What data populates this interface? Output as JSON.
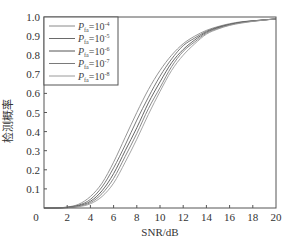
{
  "chart_data": {
    "type": "line",
    "title": "",
    "xlabel": "SNR/dB",
    "ylabel": "检测概率",
    "xlim": [
      0,
      20
    ],
    "ylim": [
      0,
      1.0
    ],
    "grid": false,
    "legend_position": "upper left",
    "x_ticks": [
      0,
      2,
      4,
      6,
      8,
      10,
      12,
      14,
      16,
      18,
      20
    ],
    "x_tick_labels": [
      "0",
      "2",
      "4",
      "6",
      "8",
      "10",
      "12",
      "14",
      "16",
      "18",
      "20"
    ],
    "y_ticks": [
      0.1,
      0.2,
      0.3,
      0.4,
      0.5,
      0.6,
      0.7,
      0.8,
      0.9,
      1.0
    ],
    "y_tick_labels": [
      "0.1",
      "0.2",
      "0.3",
      "0.4",
      "0.5",
      "0.6",
      "0.7",
      "0.8",
      "0.9",
      "1.0"
    ],
    "x": [
      0,
      1,
      2,
      3,
      4,
      5,
      6,
      7,
      8,
      9,
      10,
      11,
      12,
      13,
      14,
      15,
      16,
      17,
      18,
      19,
      20
    ],
    "series": [
      {
        "name": "P_fa=10^-4",
        "label_base": "P",
        "label_sub": "fa",
        "label_eq": "=10",
        "label_sup": "-4",
        "color": "#8a8a8a",
        "values": [
          0.0,
          0.0,
          0.005,
          0.02,
          0.06,
          0.13,
          0.24,
          0.37,
          0.5,
          0.62,
          0.72,
          0.8,
          0.86,
          0.9,
          0.93,
          0.95,
          0.965,
          0.975,
          0.98,
          0.985,
          0.99
        ]
      },
      {
        "name": "P_fa=10^-5",
        "label_base": "P",
        "label_sub": "fa",
        "label_eq": "=10",
        "label_sup": "-5",
        "color": "#6a6a6a",
        "values": [
          0.0,
          0.0,
          0.004,
          0.015,
          0.045,
          0.11,
          0.21,
          0.33,
          0.46,
          0.58,
          0.69,
          0.78,
          0.85,
          0.89,
          0.925,
          0.947,
          0.962,
          0.973,
          0.98,
          0.985,
          0.99
        ]
      },
      {
        "name": "P_fa=10^-6",
        "label_base": "P",
        "label_sub": "fa",
        "label_eq": "=10",
        "label_sup": "-6",
        "color": "#555555",
        "values": [
          0.0,
          0.0,
          0.003,
          0.012,
          0.035,
          0.09,
          0.18,
          0.3,
          0.42,
          0.55,
          0.66,
          0.76,
          0.83,
          0.88,
          0.92,
          0.944,
          0.96,
          0.972,
          0.979,
          0.985,
          0.99
        ]
      },
      {
        "name": "P_fa=10^-7",
        "label_base": "P",
        "label_sub": "fa",
        "label_eq": "=10",
        "label_sup": "-7",
        "color": "#7a7a7a",
        "values": [
          0.0,
          0.0,
          0.002,
          0.009,
          0.028,
          0.075,
          0.155,
          0.27,
          0.39,
          0.52,
          0.63,
          0.74,
          0.82,
          0.87,
          0.915,
          0.94,
          0.958,
          0.97,
          0.978,
          0.984,
          0.99
        ]
      },
      {
        "name": "P_fa=10^-8",
        "label_base": "P",
        "label_sub": "fa",
        "label_eq": "=10",
        "label_sup": "-8",
        "color": "#9a9a9a",
        "values": [
          0.0,
          0.0,
          0.0015,
          0.007,
          0.022,
          0.06,
          0.13,
          0.24,
          0.36,
          0.49,
          0.61,
          0.72,
          0.8,
          0.86,
          0.91,
          0.937,
          0.956,
          0.968,
          0.977,
          0.984,
          0.99
        ]
      }
    ]
  },
  "plot_area": {
    "left": 44,
    "right": 276,
    "top": 17,
    "bottom": 208
  },
  "colors": {
    "axis": "#555555",
    "text": "#333333",
    "background": "#ffffff"
  }
}
